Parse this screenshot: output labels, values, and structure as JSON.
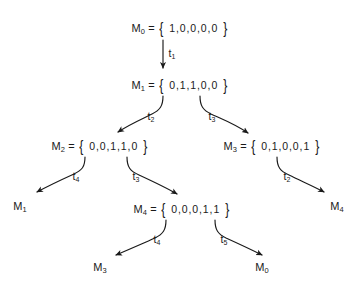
{
  "figure": {
    "kind": "reachability-graph",
    "background_color": "#ffffff",
    "ink_color": "#1a1a1a"
  },
  "nodes": [
    {
      "id": "n0",
      "name": "M",
      "index": "0",
      "eq": "=",
      "open": "{",
      "vector": "1,0,0,0,0",
      "close": "}",
      "x": 180,
      "y": 28
    },
    {
      "id": "n1",
      "name": "M",
      "index": "1",
      "eq": "=",
      "open": "{",
      "vector": "0,1,1,0,0",
      "close": "}",
      "x": 180,
      "y": 85
    },
    {
      "id": "n2",
      "name": "M",
      "index": "2",
      "eq": "=",
      "open": "{",
      "vector": "0,0,1,1,0",
      "close": "}",
      "x": 100,
      "y": 146
    },
    {
      "id": "n3",
      "name": "M",
      "index": "3",
      "eq": "=",
      "open": "{",
      "vector": "0,1,0,0,1",
      "close": "}",
      "x": 272,
      "y": 146
    },
    {
      "id": "n4",
      "name": "M",
      "index": "4",
      "eq": "=",
      "open": "{",
      "vector": "0,0,0,1,1",
      "close": "}",
      "x": 182,
      "y": 209
    }
  ],
  "leaves": [
    {
      "id": "l1",
      "name": "M",
      "index": "1",
      "x": 20,
      "y": 206
    },
    {
      "id": "l2",
      "name": "M",
      "index": "4",
      "x": 337,
      "y": 206
    },
    {
      "id": "l3",
      "name": "M",
      "index": "3",
      "x": 100,
      "y": 267
    },
    {
      "id": "l4",
      "name": "M",
      "index": "0",
      "x": 262,
      "y": 267
    }
  ],
  "transitions": [
    {
      "id": "e1",
      "name": "t",
      "index": "1",
      "from": "M0",
      "to": "M1",
      "x": 172,
      "y": 53
    },
    {
      "id": "e2",
      "name": "t",
      "index": "2",
      "from": "M1",
      "to": "M2",
      "x": 151,
      "y": 116
    },
    {
      "id": "e3",
      "name": "t",
      "index": "3",
      "from": "M1",
      "to": "M3",
      "x": 212,
      "y": 116
    },
    {
      "id": "e4",
      "name": "t",
      "index": "4",
      "from": "M2",
      "to": "M1-leaf",
      "x": 76,
      "y": 176
    },
    {
      "id": "e5",
      "name": "t",
      "index": "3",
      "from": "M2",
      "to": "M4",
      "x": 136,
      "y": 176
    },
    {
      "id": "e6",
      "name": "t",
      "index": "2",
      "from": "M3",
      "to": "M4-leaf",
      "x": 287,
      "y": 176
    },
    {
      "id": "e7",
      "name": "t",
      "index": "4",
      "from": "M4",
      "to": "M3-leaf",
      "x": 157,
      "y": 239
    },
    {
      "id": "e8",
      "name": "t",
      "index": "5",
      "from": "M4",
      "to": "M0-leaf",
      "x": 224,
      "y": 239
    }
  ],
  "edge_paths": {
    "e1": "M 163,40 L 163,68",
    "e2": "M 163,96 C 163,106 160,110 152,114 C 142,119 130,124 118,132",
    "e3": "M 200,96 C 200,106 203,110 211,114 C 222,119 235,124 248,133",
    "e4": "M 85,157 C 85,167 82,170 74,174 C 63,179 50,185 37,192",
    "e5": "M 127,157 C 127,167 130,171 139,175 C 152,181 165,187 177,194",
    "e6": "M 277,157 C 277,167 280,171 289,175 C 301,181 313,186 324,192",
    "e7": "M 166,220 C 166,230 163,234 155,238 C 144,243 130,249 116,255",
    "e8": "M 215,220 C 215,230 218,234 226,238 C 237,243 250,249 262,255"
  }
}
